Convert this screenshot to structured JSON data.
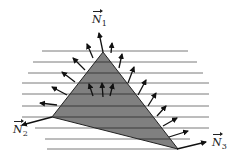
{
  "diagram": {
    "colors": {
      "triangle_fill": "#808080",
      "triangle_edge": "#222222",
      "lines": "#7a7a7a",
      "arrows": "#111111"
    },
    "labels": {
      "n1": {
        "symbol": "N",
        "sub": "1"
      },
      "n2": {
        "symbol": "N",
        "sub": "2"
      },
      "n3": {
        "symbol": "N",
        "sub": "3"
      }
    },
    "horizontal_line_count": 10,
    "edge_normal_arrows": {
      "left_edge": 6,
      "right_edge": 9,
      "interior": 3
    }
  }
}
